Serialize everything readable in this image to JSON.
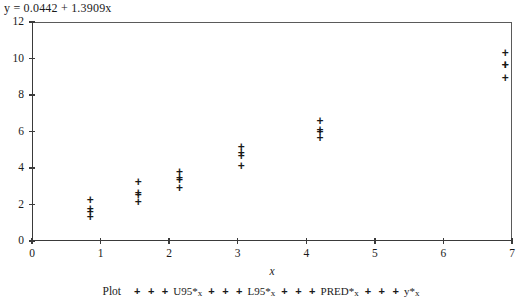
{
  "equation": "y = 0.0442 + 1.3909x",
  "axis": {
    "x_title": "x",
    "x_ticks": [
      "0",
      "1",
      "2",
      "3",
      "4",
      "5",
      "6",
      "7"
    ],
    "y_ticks": [
      "0",
      "2",
      "4",
      "6",
      "8",
      "10",
      "12"
    ]
  },
  "legend": {
    "plot_label": "Plot",
    "marks": "+ + +",
    "entries": [
      {
        "name": "U95*",
        "sub": "x"
      },
      {
        "name": "L95*",
        "sub": "x"
      },
      {
        "name": "PRED*",
        "sub": "x"
      },
      {
        "name": "y*",
        "sub": "x"
      }
    ]
  },
  "chart_data": {
    "type": "scatter",
    "title": "y = 0.0442 + 1.3909x",
    "xlabel": "x",
    "ylabel": "",
    "xlim": [
      0,
      7
    ],
    "ylim": [
      0,
      12
    ],
    "grid": false,
    "legend_position": "bottom",
    "regression": {
      "intercept": 0.0442,
      "slope": 1.3909
    },
    "series": [
      {
        "name": "U95*x",
        "x": [
          0.85,
          1.55,
          2.15,
          3.05,
          4.2,
          6.9
        ],
        "y": [
          2.2,
          3.2,
          3.75,
          5.1,
          6.55,
          10.3
        ]
      },
      {
        "name": "L95*x",
        "x": [
          0.85,
          1.55,
          2.15,
          3.05,
          4.2,
          6.9
        ],
        "y": [
          1.3,
          2.1,
          2.85,
          4.1,
          5.6,
          8.9
        ]
      },
      {
        "name": "PRED*x",
        "x": [
          0.85,
          1.55,
          2.15,
          3.05,
          4.2,
          6.9
        ],
        "y": [
          1.7,
          2.6,
          3.3,
          4.65,
          6.05,
          9.6
        ]
      },
      {
        "name": "y*x",
        "x": [
          0.85,
          1.55,
          2.15,
          3.05,
          4.2,
          6.9
        ],
        "y": [
          1.55,
          2.5,
          3.45,
          4.8,
          5.95,
          9.6
        ]
      }
    ]
  }
}
